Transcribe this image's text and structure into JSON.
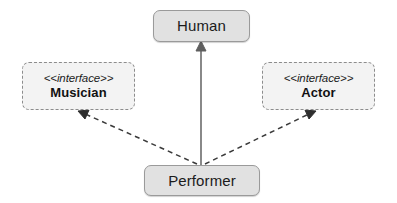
{
  "diagram": {
    "type": "uml-class-diagram",
    "background_color": "#ffffff",
    "nodes": [
      {
        "id": "human",
        "name": "Human",
        "kind": "class",
        "fill": "#e1e1e1",
        "border_color": "#9a9a9a",
        "border_style": "solid"
      },
      {
        "id": "musician",
        "name": "Musician",
        "kind": "interface",
        "stereotype": "<<interface>>",
        "fill": "#f3f3f3",
        "border_color": "#8c8c8c",
        "border_style": "dashed"
      },
      {
        "id": "actor",
        "name": "Actor",
        "kind": "interface",
        "stereotype": "<<interface>>",
        "fill": "#f3f3f3",
        "border_color": "#8c8c8c",
        "border_style": "dashed"
      },
      {
        "id": "performer",
        "name": "Performer",
        "kind": "class",
        "fill": "#e1e1e1",
        "border_color": "#9a9a9a",
        "border_style": "solid"
      }
    ],
    "relationships": [
      {
        "id": "performer-to-human",
        "from": "performer",
        "to": "human",
        "kind": "generalization",
        "line_style": "solid",
        "arrowhead": "closed-triangle",
        "stroke": "#6b6b6b"
      },
      {
        "id": "performer-to-musician",
        "from": "performer",
        "to": "musician",
        "kind": "realization",
        "line_style": "dashed",
        "arrowhead": "open-arrow",
        "stroke": "#3a3a3a"
      },
      {
        "id": "performer-to-actor",
        "from": "performer",
        "to": "actor",
        "kind": "realization",
        "line_style": "dashed",
        "arrowhead": "open-arrow",
        "stroke": "#3a3a3a"
      }
    ]
  }
}
